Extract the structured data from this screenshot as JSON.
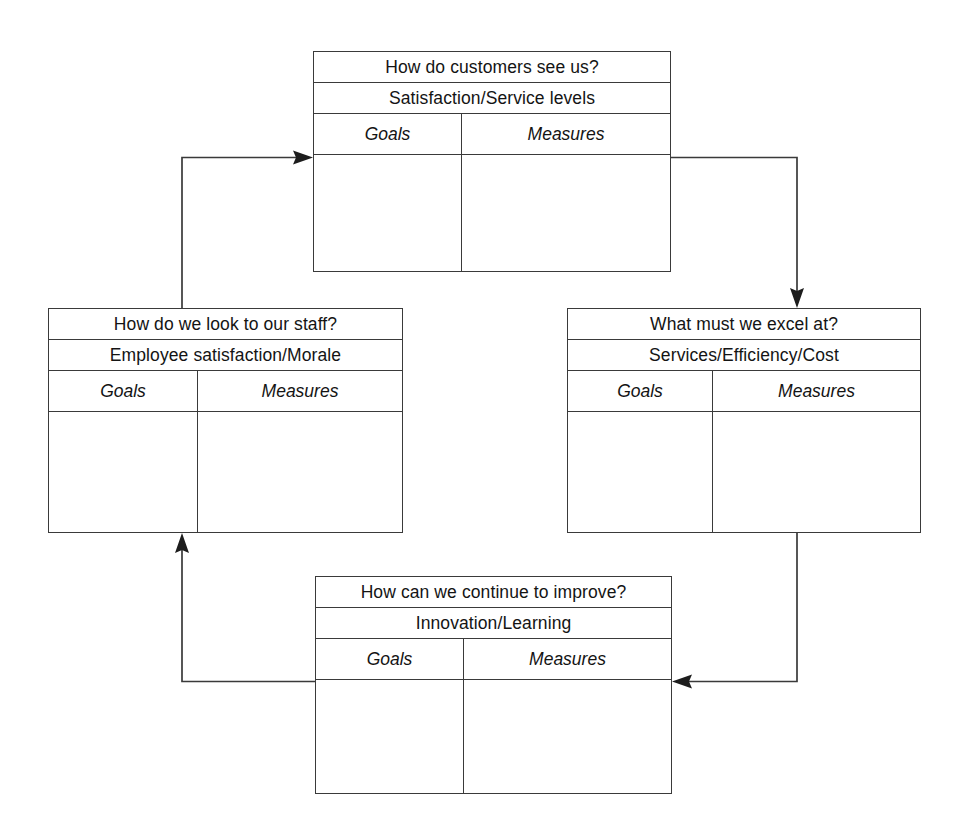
{
  "diagram": {
    "flow_direction": "clockwise",
    "line_color": "#3a3a3a",
    "text_color": "#141414",
    "background_color": "#ffffff",
    "column_headers": {
      "goals": "Goals",
      "measures": "Measures"
    },
    "perspectives": [
      {
        "id": "customer",
        "position": "top",
        "question": "How do customers see us?",
        "theme": "Satisfaction/Service levels",
        "goals_label": "Goals",
        "measures_label": "Measures",
        "goals_entries": [],
        "measures_entries": []
      },
      {
        "id": "internal-process",
        "position": "right",
        "question": "What must we excel at?",
        "theme": "Services/Efficiency/Cost",
        "goals_label": "Goals",
        "measures_label": "Measures",
        "goals_entries": [],
        "measures_entries": []
      },
      {
        "id": "innovation-learning",
        "position": "bottom",
        "question": "How can we continue to improve?",
        "theme": "Innovation/Learning",
        "goals_label": "Goals",
        "measures_label": "Measures",
        "goals_entries": [],
        "measures_entries": []
      },
      {
        "id": "staff",
        "position": "left",
        "question": "How do we look to our staff?",
        "theme": "Employee satisfaction/Morale",
        "goals_label": "Goals",
        "measures_label": "Measures",
        "goals_entries": [],
        "measures_entries": []
      }
    ],
    "connectors": [
      {
        "id": "staff-to-customer",
        "from": "staff",
        "to": "customer",
        "arrow": "arrowhead-right"
      },
      {
        "id": "customer-to-internal-process",
        "from": "customer",
        "to": "internal-process",
        "arrow": "arrowhead-down"
      },
      {
        "id": "internal-process-to-innovation",
        "from": "internal-process",
        "to": "innovation-learning",
        "arrow": "arrowhead-left"
      },
      {
        "id": "innovation-to-staff",
        "from": "innovation-learning",
        "to": "staff",
        "arrow": "arrowhead-up"
      }
    ]
  }
}
